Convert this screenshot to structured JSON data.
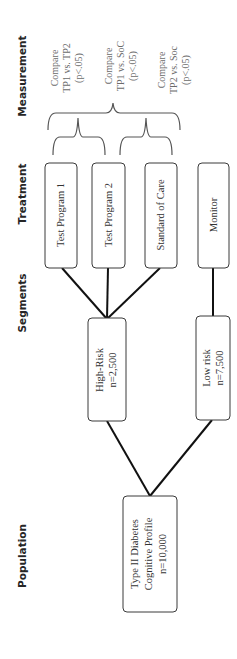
{
  "headers": {
    "measurement": "Measurement",
    "treatment": "Treatment",
    "segments": "Segments",
    "population": "Population"
  },
  "population": {
    "line1": "Type II Diabetes",
    "line2": "Cognitive Profile",
    "line3": "n=10,000"
  },
  "segments": [
    {
      "label": "High-Risk",
      "n": "n=2,500"
    },
    {
      "label": "Low risk",
      "n": "n=7,500"
    }
  ],
  "treatments": [
    {
      "label": "Test Program 1"
    },
    {
      "label": "Test Program 2"
    },
    {
      "label": "Standard of Care"
    },
    {
      "label": "Monitor"
    }
  ],
  "measurements": [
    {
      "line1": "Compare",
      "line2": "TP1 vs. TP2",
      "line3": "(p<.05)"
    },
    {
      "line1": "Compare",
      "line2": "TP1 vs. SoC",
      "line3": "(p<.05)"
    },
    {
      "line1": "Compare",
      "line2": "TP2 vs. Soc",
      "line3": "(p<.05)"
    }
  ],
  "colors": {
    "connector": "#111111",
    "box_border": "#3a3a3a",
    "measurement_text": "#6b6b6b",
    "header_text": "#262626"
  }
}
